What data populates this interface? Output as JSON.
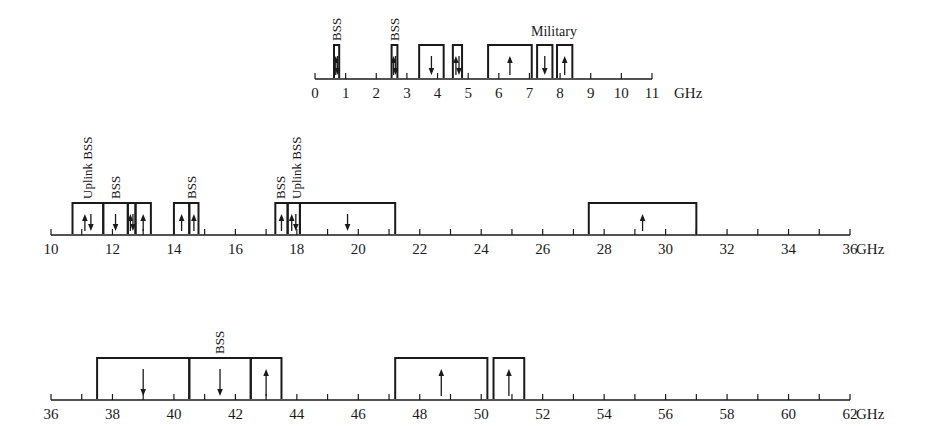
{
  "unit": "GHz",
  "colors": {
    "ink": "#1a1a1a",
    "background": "#ffffff"
  },
  "rows": [
    {
      "id": "row-0-11",
      "range": [
        0,
        11
      ],
      "axis": {
        "y": 79,
        "x0": 315,
        "x1": 652
      },
      "major_step": 1,
      "minor_step": 1,
      "tick_labels": [
        "0",
        "1",
        "2",
        "3",
        "4",
        "5",
        "6",
        "7",
        "8",
        "9",
        "10",
        "11"
      ],
      "unit_label": "GHz",
      "bracket_top": 45,
      "bands": [
        {
          "start": 0.62,
          "end": 0.79,
          "arrows": [
            "up",
            "down"
          ],
          "label": "BSS",
          "label_rot": true
        },
        {
          "start": 2.5,
          "end": 2.69,
          "arrows": [
            "up",
            "down"
          ],
          "label": "BSS",
          "label_rot": true
        },
        {
          "start": 3.4,
          "end": 4.2,
          "arrows": [
            "down"
          ]
        },
        {
          "start": 4.5,
          "end": 4.8,
          "arrows": [
            "up",
            "down"
          ]
        },
        {
          "start": 5.65,
          "end": 7.075,
          "arrows": [
            "up"
          ]
        },
        {
          "start": 7.25,
          "end": 7.75,
          "arrows": [
            "down"
          ]
        },
        {
          "start": 7.9,
          "end": 8.4,
          "arrows": [
            "up"
          ]
        }
      ],
      "group_labels": [
        {
          "text": "Military",
          "at": 7.8,
          "y": 36
        }
      ]
    },
    {
      "id": "row-10-36",
      "range": [
        10,
        36
      ],
      "axis": {
        "y": 235,
        "x0": 51,
        "x1": 850
      },
      "major_step": 2,
      "minor_step": 1,
      "tick_labels": [
        "10",
        "12",
        "14",
        "16",
        "18",
        "20",
        "22",
        "24",
        "26",
        "28",
        "30",
        "32",
        "34",
        "36"
      ],
      "unit_label": "GHz",
      "bracket_top": 203,
      "bands": [
        {
          "start": 10.7,
          "end": 11.7,
          "arrows": [
            "up",
            "down"
          ]
        },
        {
          "start": 11.7,
          "end": 12.5,
          "arrows": [
            "down"
          ]
        },
        {
          "start": 12.5,
          "end": 12.75,
          "arrows": [
            "up",
            "down"
          ]
        },
        {
          "start": 12.75,
          "end": 13.25,
          "arrows": [
            "up"
          ]
        },
        {
          "start": 14.0,
          "end": 14.5,
          "arrows": [
            "up"
          ]
        },
        {
          "start": 14.5,
          "end": 14.8,
          "arrows": [
            "up"
          ]
        },
        {
          "start": 17.3,
          "end": 17.7,
          "arrows": [
            "up"
          ]
        },
        {
          "start": 17.7,
          "end": 18.1,
          "arrows": [
            "up",
            "down"
          ]
        },
        {
          "start": 18.1,
          "end": 21.2,
          "arrows": [
            "down"
          ]
        },
        {
          "start": 27.5,
          "end": 31.0,
          "arrows": [
            "up"
          ]
        }
      ],
      "rot_labels": [
        {
          "text": "Uplink BSS",
          "at": 11.2
        },
        {
          "text": "BSS",
          "at": 12.1
        },
        {
          "text": "BSS",
          "at": 14.6
        },
        {
          "text": "BSS",
          "at": 17.5
        },
        {
          "text": "Uplink BSS",
          "at": 18.0
        }
      ]
    },
    {
      "id": "row-36-62",
      "range": [
        36,
        62
      ],
      "axis": {
        "y": 400,
        "x0": 51,
        "x1": 850
      },
      "major_step": 2,
      "minor_step": 1,
      "tick_labels": [
        "36",
        "38",
        "40",
        "42",
        "44",
        "46",
        "48",
        "50",
        "52",
        "54",
        "56",
        "58",
        "60",
        "62"
      ],
      "unit_label": "GHz",
      "bracket_top": 358,
      "bands": [
        {
          "start": 37.5,
          "end": 40.5,
          "arrows": [
            "down"
          ]
        },
        {
          "start": 40.5,
          "end": 42.5,
          "arrows": [
            "down"
          ]
        },
        {
          "start": 42.5,
          "end": 43.5,
          "arrows": [
            "up"
          ]
        },
        {
          "start": 47.2,
          "end": 50.2,
          "arrows": [
            "up"
          ]
        },
        {
          "start": 50.4,
          "end": 51.4,
          "arrows": [
            "up"
          ]
        }
      ],
      "rot_labels": [
        {
          "text": "BSS",
          "at": 41.5
        }
      ]
    }
  ]
}
